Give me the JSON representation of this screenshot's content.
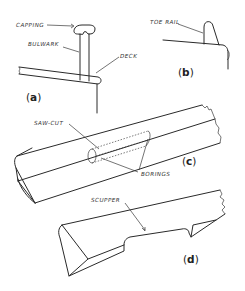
{
  "figure": {
    "panels": [
      {
        "id": "a",
        "caption": "(a)",
        "caption_letter": "a",
        "labels": [
          {
            "key": "capping",
            "text": "CAPPING"
          },
          {
            "key": "bulwark",
            "text": "BULWARK"
          },
          {
            "key": "deck",
            "text": "DECK"
          }
        ]
      },
      {
        "id": "b",
        "caption": "(b)",
        "caption_letter": "b",
        "labels": [
          {
            "key": "toe_rail",
            "text": "TOE RAIL"
          }
        ]
      },
      {
        "id": "c",
        "caption": "(c)",
        "caption_letter": "c",
        "labels": [
          {
            "key": "saw_cut",
            "text": "SAW-CUT"
          },
          {
            "key": "borings",
            "text": "BORINGS"
          }
        ]
      },
      {
        "id": "d",
        "caption": "(d)",
        "caption_letter": "d",
        "labels": [
          {
            "key": "scupper",
            "text": "SCUPPER"
          }
        ]
      }
    ]
  },
  "colors": {
    "line": "#2a2a2a",
    "background": "#ffffff"
  }
}
